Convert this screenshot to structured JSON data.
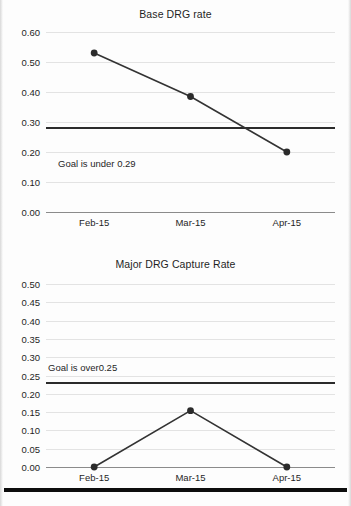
{
  "chart_data": [
    {
      "type": "line",
      "title": "Base DRG rate",
      "xlabel": "",
      "ylabel": "",
      "categories": [
        "Feb-15",
        "Mar-15",
        "Apr-15"
      ],
      "values": [
        0.53,
        0.385,
        0.2
      ],
      "ylim": [
        0.0,
        0.6
      ],
      "yticks": [
        "0.00",
        "0.10",
        "0.20",
        "0.30",
        "0.40",
        "0.50",
        "0.60"
      ],
      "ytick_values": [
        0.0,
        0.1,
        0.2,
        0.3,
        0.4,
        0.5,
        0.6
      ],
      "grid": true,
      "legend": "none",
      "goal_line_value": 0.28,
      "annotation": "Goal is under 0.29",
      "series_color": "#333333",
      "marker_color": "#2b2b2b",
      "goal_color": "#2b2b2b"
    },
    {
      "type": "line",
      "title": "Major DRG Capture Rate",
      "xlabel": "",
      "ylabel": "",
      "categories": [
        "Feb-15",
        "Mar-15",
        "Apr-15"
      ],
      "values": [
        0.0,
        0.154,
        0.0
      ],
      "ylim": [
        0.0,
        0.5
      ],
      "yticks": [
        "0.00",
        "0.05",
        "0.10",
        "0.15",
        "0.20",
        "0.25",
        "0.30",
        "0.35",
        "0.40",
        "0.45",
        "0.50"
      ],
      "ytick_values": [
        0.0,
        0.05,
        0.1,
        0.15,
        0.2,
        0.25,
        0.3,
        0.35,
        0.4,
        0.45,
        0.5
      ],
      "grid": true,
      "legend": "none",
      "goal_line_value": 0.23,
      "annotation": "Goal is over0.25",
      "series_color": "#333333",
      "marker_color": "#2b2b2b",
      "goal_color": "#2b2b2b"
    }
  ]
}
